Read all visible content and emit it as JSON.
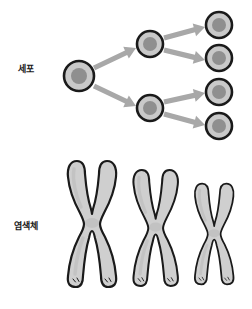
{
  "figure": {
    "title": "",
    "background_color": "#ffffff"
  },
  "rows": {
    "cell": {
      "label": "세포",
      "label_x": 18,
      "label_y": 65
    },
    "chromosome": {
      "label": "염색체",
      "label_x": 14,
      "label_y": 222
    }
  },
  "colors": {
    "membrane": "#1a1a1a",
    "cytoplasm": "#c9c9c9",
    "nucleus": "#8f8f8f",
    "arrow": "#a8a8a8",
    "chromosome_outline": "#1a1a1a",
    "chromosome_fill": "#cfcfcf",
    "chromosome_shade": "#b8b8b8",
    "text": "#1a1a1a"
  },
  "cell_division": {
    "description": "세포 분열 계통도",
    "generations": [
      1,
      2,
      4
    ],
    "cells": [
      {
        "id": "cell-g0-1",
        "generation": 0,
        "cx": 79,
        "cy": 76,
        "r": 15,
        "nucleus_r": 8
      },
      {
        "id": "cell-g1-1",
        "generation": 1,
        "cx": 150,
        "cy": 44,
        "r": 13,
        "nucleus_r": 7
      },
      {
        "id": "cell-g1-2",
        "generation": 1,
        "cx": 150,
        "cy": 108,
        "r": 13,
        "nucleus_r": 7
      },
      {
        "id": "cell-g2-1",
        "generation": 2,
        "cx": 219,
        "cy": 25,
        "r": 13,
        "nucleus_r": 7
      },
      {
        "id": "cell-g2-2",
        "generation": 2,
        "cx": 219,
        "cy": 58,
        "r": 13,
        "nucleus_r": 7
      },
      {
        "id": "cell-g2-3",
        "generation": 2,
        "cx": 219,
        "cy": 92,
        "r": 13,
        "nucleus_r": 7
      },
      {
        "id": "cell-g2-4",
        "generation": 2,
        "cx": 219,
        "cy": 126,
        "r": 13,
        "nucleus_r": 7
      }
    ],
    "arrows": [
      {
        "id": "arrow-g0-to-g1-1",
        "x1": 94,
        "y1": 68,
        "x2": 136,
        "y2": 48
      },
      {
        "id": "arrow-g0-to-g1-2",
        "x1": 94,
        "y1": 86,
        "x2": 136,
        "y2": 106
      },
      {
        "id": "arrow-g1-1-to-g2-1",
        "x1": 164,
        "y1": 38,
        "x2": 205,
        "y2": 27
      },
      {
        "id": "arrow-g1-1-to-g2-2",
        "x1": 164,
        "y1": 50,
        "x2": 205,
        "y2": 60
      },
      {
        "id": "arrow-g1-2-to-g2-3",
        "x1": 164,
        "y1": 102,
        "x2": 205,
        "y2": 93
      },
      {
        "id": "arrow-g1-2-to-g2-4",
        "x1": 164,
        "y1": 114,
        "x2": 205,
        "y2": 125
      }
    ]
  },
  "chromosomes": [
    {
      "id": "chromosome-1",
      "index": 1,
      "cx": 88,
      "cy": 224,
      "scale": 1.0,
      "size_label": "large"
    },
    {
      "id": "chromosome-2",
      "index": 2,
      "cx": 152,
      "cy": 228,
      "scale": 0.92,
      "size_label": "medium"
    },
    {
      "id": "chromosome-3",
      "index": 3,
      "cx": 211,
      "cy": 234,
      "scale": 0.8,
      "size_label": "small"
    }
  ]
}
